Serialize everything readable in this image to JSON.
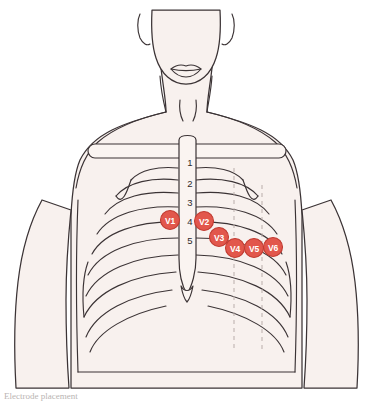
{
  "figure": {
    "background_color": "#ffffff",
    "skin_fill": "#f8f1ee",
    "bone_fill": "#faf4f1",
    "outline_color": "#3b3335",
    "marker_fill": "#e2574c",
    "marker_stroke": "#c13b31",
    "marker_text_color": "#ffffff",
    "reference_line_color": "#b9adaa"
  },
  "caption": {
    "text": "Electrode placement"
  },
  "rib_numbers": [
    {
      "label": "1",
      "x": 190,
      "y": 163
    },
    {
      "label": "2",
      "x": 190,
      "y": 184
    },
    {
      "label": "3",
      "x": 190,
      "y": 203
    },
    {
      "label": "4",
      "x": 190,
      "y": 222
    },
    {
      "label": "5",
      "x": 190,
      "y": 241
    }
  ],
  "leads": [
    {
      "id": "V1",
      "label": "V1",
      "x": 170,
      "y": 220,
      "r": 9.5
    },
    {
      "id": "V2",
      "label": "V2",
      "x": 204,
      "y": 221,
      "r": 9.5
    },
    {
      "id": "V3",
      "label": "V3",
      "x": 219,
      "y": 237,
      "r": 9.5
    },
    {
      "id": "V4",
      "label": "V4",
      "x": 235,
      "y": 248,
      "r": 9.5
    },
    {
      "id": "V5",
      "label": "V5",
      "x": 254,
      "y": 248,
      "r": 9.5
    },
    {
      "id": "V6",
      "label": "V6",
      "x": 273,
      "y": 247,
      "r": 9.5
    }
  ],
  "reference_lines": [
    {
      "name": "midclavicular-line",
      "x": 234,
      "y1": 168,
      "y2": 352
    },
    {
      "name": "anterior-axillary-line",
      "x": 262,
      "y1": 185,
      "y2": 352
    }
  ],
  "anatomy_parts": [
    "head-chin",
    "mouth",
    "neck",
    "sternal-notch",
    "left-shoulder",
    "right-shoulder",
    "left-arm",
    "right-arm",
    "torso",
    "clavicle-bar",
    "sternum",
    "xiphoid-process",
    "ribcage"
  ]
}
